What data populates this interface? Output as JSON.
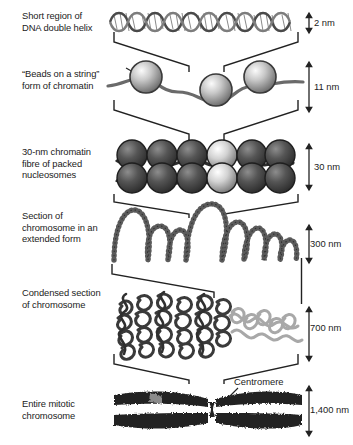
{
  "figure": {
    "background_color": "#ffffff",
    "ink_color": "#222222"
  },
  "levels": [
    {
      "id": "dna-double-helix",
      "label": "Short region of\nDNA double helix",
      "scale": "2 nm",
      "art": "double-helix"
    },
    {
      "id": "beads-on-a-string",
      "label": "“Beads on a string”\nform of chromatin",
      "scale": "11 nm",
      "art": "nucleosome-beads"
    },
    {
      "id": "thirty-nm-fibre",
      "label": "30-nm chromatin\nfibre of packed\nnucleosomes",
      "scale": "30 nm",
      "art": "packed-nucleosome-fibre"
    },
    {
      "id": "extended-chromosome",
      "label": "Section of\nchromosome in an\nextended form",
      "scale": "300 nm",
      "art": "looped-fibre"
    },
    {
      "id": "condensed-chromosome",
      "label": "Condensed section\nof chromosome",
      "scale": "700 nm",
      "art": "condensed-coils"
    },
    {
      "id": "mitotic-chromosome",
      "label": "Entire mitotic\nchromosome",
      "scale": "1,400 nm",
      "art": "metaphase-chromosome"
    }
  ],
  "annotations": [
    {
      "id": "centromere",
      "label": "Centromere"
    }
  ],
  "colors": {
    "bead_light": "#f2f2f2",
    "bead_mid": "#9a9a9a",
    "bead_dark": "#3f3f3f",
    "chromosome_dark": "#242424",
    "strand_gray": "#808080",
    "line": "#222222"
  }
}
